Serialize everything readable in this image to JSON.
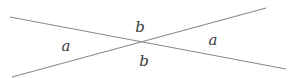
{
  "diagram": {
    "line_color": "#8a8a8a",
    "text_color": "#3a3a3a",
    "lines": [
      {
        "id": "line-1",
        "x1": 10,
        "y1": 17,
        "x2": 286,
        "y2": 69
      },
      {
        "id": "line-2",
        "x1": 12,
        "y1": 77,
        "x2": 266,
        "y2": 8
      }
    ],
    "intersection": {
      "x": 141,
      "y": 43
    },
    "labels": {
      "top": {
        "text": "b",
        "x": 140,
        "y": 27
      },
      "bottom": {
        "text": "b",
        "x": 144,
        "y": 61
      },
      "left": {
        "text": "a",
        "x": 66,
        "y": 46
      },
      "right": {
        "text": "a",
        "x": 213,
        "y": 40
      }
    }
  }
}
